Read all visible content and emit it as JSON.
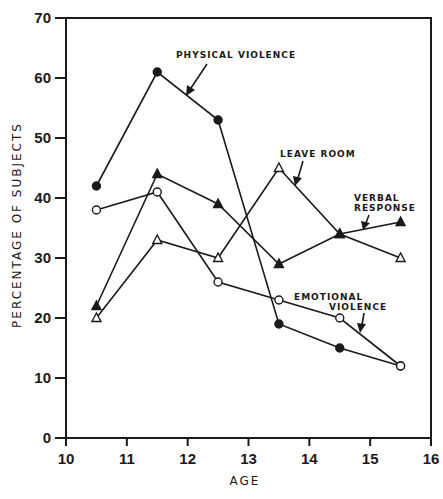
{
  "chart_data": {
    "type": "line",
    "title": "",
    "xlabel": "AGE",
    "ylabel": "PERCENTAGE OF SUBJECTS",
    "xlim": [
      10,
      16
    ],
    "ylim": [
      0,
      70
    ],
    "x_ticks": [
      10,
      11,
      12,
      13,
      14,
      15,
      16
    ],
    "y_ticks": [
      0,
      10,
      20,
      30,
      40,
      50,
      60,
      70
    ],
    "grid": false,
    "legend": "inline annotations with arrows",
    "x": [
      10.5,
      11.5,
      12.5,
      13.5,
      14.5,
      15.5
    ],
    "series": [
      {
        "name": "PHYSICAL VIOLENCE",
        "marker": "filled-circle",
        "values": [
          42,
          61,
          53,
          19,
          15,
          12
        ]
      },
      {
        "name": "EMOTIONAL VIOLENCE",
        "marker": "open-circle",
        "values": [
          38,
          41,
          26,
          23,
          20,
          12
        ]
      },
      {
        "name": "LEAVE ROOM",
        "marker": "open-triangle",
        "values": [
          20,
          33,
          30,
          45,
          34,
          30
        ]
      },
      {
        "name": "VERBAL RESPONSE",
        "marker": "filled-triangle",
        "values": [
          22,
          44,
          39,
          29,
          34,
          36
        ]
      }
    ],
    "annotations": [
      {
        "text": "PHYSICAL VIOLENCE",
        "series": "PHYSICAL VIOLENCE"
      },
      {
        "text": "LEAVE ROOM",
        "series": "LEAVE ROOM"
      },
      {
        "text": [
          "VERBAL",
          "RESPONSE"
        ],
        "series": "VERBAL RESPONSE"
      },
      {
        "text": [
          "EMOTIONAL",
          "VIOLENCE"
        ],
        "series": "EMOTIONAL VIOLENCE"
      }
    ]
  },
  "labels": {
    "xlabel": "AGE",
    "ylabel": "PERCENTAGE OF SUBJECTS",
    "physical": "PHYSICAL VIOLENCE",
    "leave": "LEAVE ROOM",
    "verbal_1": "VERBAL",
    "verbal_2": "RESPONSE",
    "emotional_1": "EMOTIONAL",
    "emotional_2": "VIOLENCE"
  }
}
